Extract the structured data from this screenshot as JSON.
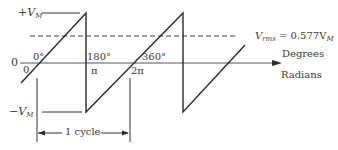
{
  "diagram": {
    "labels": {
      "vm_pos": "+V",
      "vm_pos_sub": "M",
      "vm_neg": "−V",
      "vm_neg_sub": "M",
      "origin_left": "0",
      "origin_below": "0",
      "deg_0": "0°",
      "deg_180": "180°",
      "rad_pi": "π",
      "deg_360": "360°",
      "rad_2pi": "2π",
      "vrms_prefix": "V",
      "vrms_sub": "rms",
      "vrms_eq": " = 0.577V",
      "vrms_eq_sub": "M",
      "axis_degrees": "Degrees",
      "axis_radians": "Radians",
      "cycle": "1 cycle"
    },
    "colors": {
      "line": "#2a2a2a",
      "text": "#3a3a3a"
    }
  }
}
